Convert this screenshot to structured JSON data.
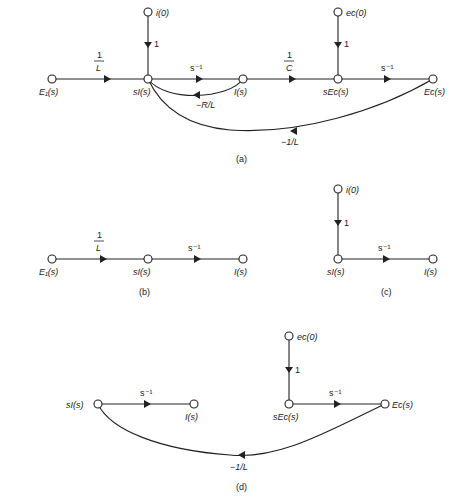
{
  "panels": {
    "a": {
      "caption": "(a)",
      "nodes": {
        "E1": "E₁(s)",
        "sI": "sI(s)",
        "I": "I(s)",
        "sEc": "sEᴄ(s)",
        "Ec": "Eᴄ(s)",
        "i0": "i(0)",
        "ec0": "eᴄ(0)"
      },
      "gains": {
        "E1_sI_num": "1",
        "E1_sI_den": "L",
        "sI_I": "s⁻¹",
        "I_sEc_num": "1",
        "I_sEc_den": "C",
        "sEc_Ec": "s⁻¹",
        "i0_sI": "1",
        "ec0_sEc": "1",
        "I_sI": "−R/L",
        "Ec_sI": "−1/L"
      }
    },
    "b": {
      "caption": "(b)",
      "nodes": {
        "E1": "E₁(s)",
        "sI": "sI(s)",
        "I": "I(s)"
      },
      "gains": {
        "E1_sI_num": "1",
        "E1_sI_den": "L",
        "sI_I": "s⁻¹"
      }
    },
    "c": {
      "caption": "(c)",
      "nodes": {
        "i0": "i(0)",
        "sI": "sI(s)",
        "I": "I(s)"
      },
      "gains": {
        "i0_sI": "1",
        "sI_I": "s⁻¹"
      }
    },
    "d": {
      "caption": "(d)",
      "nodes": {
        "sI": "sI(s)",
        "I": "I(s)",
        "ec0": "eᴄ(0)",
        "sEc": "sEᴄ(s)",
        "Ec": "Eᴄ(s)"
      },
      "gains": {
        "sI_I": "s⁻¹",
        "ec0_sEc": "1",
        "sEc_Ec": "s⁻¹",
        "Ec_sI": "−1/L"
      }
    }
  }
}
